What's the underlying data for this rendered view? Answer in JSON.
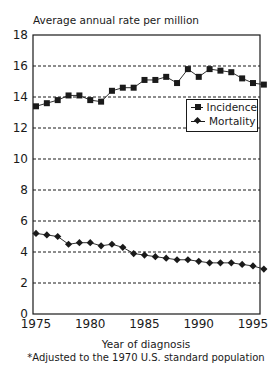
{
  "chart_data": {
    "type": "line",
    "title": "",
    "ylabel": "Average annual rate per million",
    "xlabel": "Year of diagnosis",
    "footnote": "*Adjusted to the 1970 U.S. standard population",
    "ylim": [
      0,
      18
    ],
    "xlim": [
      1975,
      1996
    ],
    "yticks": [
      0,
      2,
      4,
      6,
      8,
      10,
      12,
      14,
      16,
      18
    ],
    "xticks": [
      1975,
      1980,
      1985,
      1990,
      1995
    ],
    "grid": "horizontal dashed",
    "legend_position": "upper right, inside plot",
    "x": [
      1975,
      1976,
      1977,
      1978,
      1979,
      1980,
      1981,
      1982,
      1983,
      1984,
      1985,
      1986,
      1987,
      1988,
      1989,
      1990,
      1991,
      1992,
      1993,
      1994,
      1995,
      1996
    ],
    "series": [
      {
        "name": "Incidence",
        "marker": "square",
        "values": [
          13.4,
          13.6,
          13.8,
          14.1,
          14.1,
          13.8,
          13.7,
          14.4,
          14.6,
          14.6,
          15.1,
          15.1,
          15.3,
          14.9,
          15.8,
          15.3,
          15.8,
          15.7,
          15.6,
          15.2,
          14.9,
          14.8
        ]
      },
      {
        "name": "Mortality",
        "marker": "diamond",
        "values": [
          5.2,
          5.1,
          5.0,
          4.5,
          4.6,
          4.6,
          4.4,
          4.5,
          4.3,
          3.9,
          3.8,
          3.7,
          3.6,
          3.5,
          3.5,
          3.4,
          3.3,
          3.3,
          3.3,
          3.2,
          3.1,
          2.9
        ]
      }
    ]
  },
  "labels": {
    "ylabel": "Average annual rate per million",
    "xlabel": "Year of diagnosis",
    "footnote": "*Adjusted to the 1970 U.S. standard population",
    "legend_incidence": "Incidence",
    "legend_mortality": "Mortality"
  },
  "colors": {
    "ink": "#1a1a1a",
    "background": "#ffffff"
  }
}
